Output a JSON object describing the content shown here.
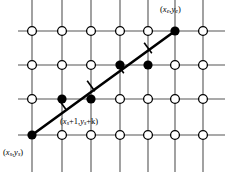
{
  "figure": {
    "name": "bresenham-line-rasterization-grid",
    "background": "#ffffff",
    "width": 225,
    "height": 172,
    "ink_color": "#000000",
    "grid_line_color": "#555555",
    "open_point_fill": "#ffffff"
  },
  "grid": {
    "columns_x": [
      32,
      62,
      91,
      120,
      148,
      175,
      203
    ],
    "rows_y": [
      31,
      65,
      99,
      135
    ],
    "vline_top": 0,
    "vline_bottom": 172,
    "hline_left": 18,
    "hline_right": 225,
    "line_width": 1.1,
    "open_radius": 4.4,
    "open_stroke": 1.3
  },
  "open_points": [
    {
      "col": 0,
      "row": 0
    },
    {
      "col": 1,
      "row": 0
    },
    {
      "col": 2,
      "row": 0
    },
    {
      "col": 3,
      "row": 0
    },
    {
      "col": 4,
      "row": 0
    },
    {
      "col": 6,
      "row": 0
    },
    {
      "col": 0,
      "row": 1
    },
    {
      "col": 1,
      "row": 1
    },
    {
      "col": 2,
      "row": 1
    },
    {
      "col": 5,
      "row": 1
    },
    {
      "col": 6,
      "row": 1
    },
    {
      "col": 0,
      "row": 2
    },
    {
      "col": 3,
      "row": 2
    },
    {
      "col": 4,
      "row": 2
    },
    {
      "col": 5,
      "row": 2
    },
    {
      "col": 6,
      "row": 2
    },
    {
      "col": 1,
      "row": 3
    },
    {
      "col": 2,
      "row": 3
    },
    {
      "col": 3,
      "row": 3
    },
    {
      "col": 4,
      "row": 3
    },
    {
      "col": 5,
      "row": 3
    },
    {
      "col": 6,
      "row": 3
    }
  ],
  "filled_points": [
    {
      "col": 0,
      "row": 3,
      "role": "start-pixel"
    },
    {
      "col": 1,
      "row": 2,
      "role": "chosen-pixel"
    },
    {
      "col": 2,
      "row": 2,
      "role": "chosen-pixel"
    },
    {
      "col": 3,
      "row": 1,
      "role": "chosen-pixel"
    },
    {
      "col": 4,
      "row": 1,
      "role": "chosen-pixel"
    },
    {
      "col": 5,
      "row": 0,
      "role": "end-pixel"
    }
  ],
  "filled_radius": 4.6,
  "ideal_line": {
    "x1": 32,
    "y1": 135,
    "x2": 175,
    "y2": 31,
    "stroke_width": 2.6
  },
  "error_ticks": [
    {
      "x": 62,
      "y": 104,
      "length": 13,
      "stroke_width": 1.6
    },
    {
      "x": 91,
      "y": 86,
      "length": 13,
      "stroke_width": 1.6
    },
    {
      "x": 120,
      "y": 68,
      "length": 13,
      "stroke_width": 1.6
    },
    {
      "x": 148,
      "y": 48,
      "length": 13,
      "stroke_width": 1.6
    }
  ],
  "labels": {
    "end_point": {
      "text": "(xₑ,yₑ)",
      "prefix": "(",
      "var1": "x",
      "sub1": "e",
      "sep": ",",
      "var2": "y",
      "sub2": "e",
      "suffix": ")",
      "x": 160,
      "y": 5
    },
    "start_point": {
      "text": "(xₛ,yₛ)",
      "prefix": "(",
      "var1": "x",
      "sub1": "s",
      "sep": ",",
      "var2": "y",
      "sub2": "s",
      "suffix": ")",
      "x": 3,
      "y": 148
    },
    "next_point": {
      "text": "(xₛ+1,yₛ+k)",
      "prefix": "(",
      "var1": "x",
      "sub1": "s",
      "inc1": "+1",
      "sep": ",",
      "var2": "y",
      "sub2": "s",
      "inc2": "+k",
      "suffix": ")",
      "x": 60,
      "y": 117
    }
  }
}
